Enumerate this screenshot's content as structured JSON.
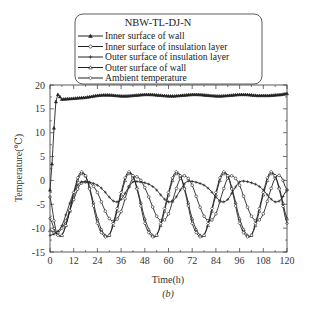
{
  "chart_data": {
    "type": "line",
    "title": "NBW-TL-DJ-N",
    "caption": "(b)",
    "xlabel": "Time(h)",
    "ylabel": "Temperature(℃)",
    "xlim": [
      0,
      120
    ],
    "ylim": [
      -15,
      20
    ],
    "xticks": [
      0,
      12,
      24,
      36,
      48,
      60,
      72,
      84,
      96,
      108,
      120
    ],
    "yticks": [
      -15,
      -10,
      -5,
      0,
      5,
      10,
      15,
      20
    ],
    "grid": false,
    "legend_position": "top-center, inside box",
    "x": [
      0,
      3,
      6,
      9,
      12,
      15,
      18,
      21,
      24,
      27,
      30,
      33,
      36,
      39,
      42,
      45,
      48,
      51,
      54,
      57,
      60,
      63,
      66,
      69,
      72,
      75,
      78,
      81,
      84,
      87,
      90,
      93,
      96,
      99,
      102,
      105,
      108,
      111,
      114,
      117,
      120
    ],
    "series": [
      {
        "name": "Inner surface of wall",
        "marker": "triangle",
        "values": [
          -2,
          16.5,
          17.0,
          17.1,
          17.2,
          17.3,
          17.4,
          17.6,
          17.8,
          17.9,
          17.9,
          17.8,
          17.7,
          17.7,
          17.8,
          17.9,
          18.0,
          18.0,
          17.9,
          17.8,
          17.7,
          17.7,
          17.8,
          17.9,
          18.0,
          18.0,
          17.9,
          17.8,
          17.7,
          17.7,
          17.8,
          17.9,
          18.0,
          18.0,
          17.9,
          17.8,
          17.8,
          17.8,
          17.9,
          18.0,
          18.2
        ]
      },
      {
        "name": "Inner surface of insulation layer",
        "marker": "circle",
        "values": [
          -3.5,
          -10.5,
          -10.0,
          -7.5,
          -4.0,
          -1.0,
          -0.3,
          -0.8,
          -2.5,
          -5.5,
          -8.0,
          -8.5,
          -6.5,
          -2.5,
          0.5,
          0.5,
          -1.5,
          -4.5,
          -7.5,
          -8.5,
          -7.0,
          -3.0,
          0.5,
          0.8,
          -1.0,
          -4.5,
          -7.5,
          -8.5,
          -7.0,
          -3.0,
          0.5,
          0.8,
          -1.0,
          -4.5,
          -7.5,
          -8.5,
          -7.0,
          -3.0,
          0.5,
          0.8,
          -2.0
        ]
      },
      {
        "name": "Outer surface of insulation layer",
        "marker": "plus",
        "values": [
          -11.5,
          -11.0,
          -9.5,
          -6.0,
          -2.5,
          -0.5,
          -0.3,
          -0.5,
          -1.0,
          -2.0,
          -3.5,
          -4.5,
          -4.0,
          -2.0,
          -0.3,
          -0.3,
          -0.5,
          -1.0,
          -2.0,
          -3.5,
          -4.5,
          -4.0,
          -2.0,
          -0.3,
          -0.2,
          -0.5,
          -1.0,
          -2.0,
          -3.5,
          -4.5,
          -4.0,
          -2.0,
          -0.3,
          -0.2,
          -0.5,
          -1.0,
          -2.0,
          -3.5,
          -4.5,
          -4.0,
          -2.0
        ]
      },
      {
        "name": "Outer surface of wall",
        "marker": "triangle-open",
        "values": [
          -10.5,
          -11.0,
          -11.5,
          -8.0,
          -3.0,
          1.0,
          1.0,
          -3.0,
          -8.0,
          -11.0,
          -11.5,
          -8.0,
          -3.0,
          1.0,
          1.0,
          -3.0,
          -8.0,
          -11.0,
          -11.5,
          -8.0,
          -3.0,
          1.0,
          1.0,
          -3.0,
          -8.0,
          -11.0,
          -11.5,
          -8.0,
          -3.0,
          1.0,
          1.0,
          -3.0,
          -8.0,
          -11.0,
          -11.5,
          -8.0,
          -3.0,
          1.0,
          1.0,
          -3.0,
          -8.0
        ]
      },
      {
        "name": "Ambient temperature",
        "marker": "diamond",
        "values": [
          -8.0,
          -11.0,
          -11.5,
          -8.0,
          -2.5,
          1.5,
          1.0,
          -3.5,
          -9.0,
          -11.5,
          -11.5,
          -7.5,
          -2.5,
          1.5,
          1.0,
          -3.5,
          -9.0,
          -11.5,
          -11.5,
          -7.5,
          -2.5,
          1.5,
          1.0,
          -3.5,
          -9.0,
          -11.5,
          -11.5,
          -7.5,
          -2.5,
          1.5,
          1.0,
          -3.5,
          -9.0,
          -11.5,
          -11.5,
          -7.5,
          -2.5,
          1.5,
          1.0,
          -3.5,
          -9.0
        ]
      }
    ]
  },
  "legend": {
    "title": "NBW-TL-DJ-N",
    "items": [
      "Inner surface of wall",
      "Inner surface of insulation layer",
      "Outer surface of insulation layer",
      "Outer surface of wall",
      "Ambient temperature"
    ]
  },
  "colors": {
    "line": "#222222",
    "axis": "#333333",
    "background": "#ffffff"
  }
}
